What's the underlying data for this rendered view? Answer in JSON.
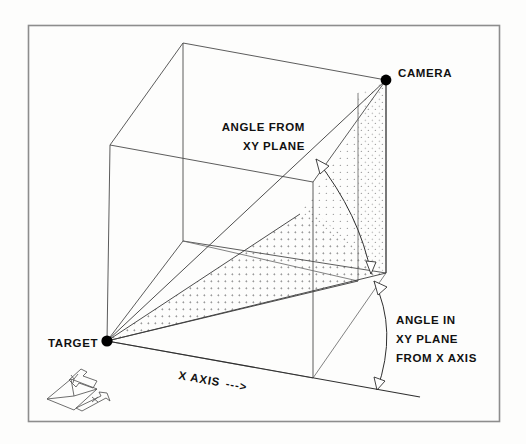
{
  "figure": {
    "kind": "technical-line-diagram",
    "title_text_visible": false,
    "background_color": "#fdfdfc",
    "frame_color": "#8d8d8d",
    "ink_color": "#2f2f2f",
    "stipple_color": "#9a9a9a"
  },
  "labels": {
    "camera": "CAMERA",
    "target": "TARGET",
    "angle_from_xy_plane": [
      "ANGLE FROM",
      "XY PLANE"
    ],
    "angle_in_xy_plane": [
      "ANGLE IN",
      "XY PLANE",
      "FROM X AXIS"
    ],
    "x_axis": "X AXIS",
    "x_axis_arrow": "--->"
  },
  "points": {
    "camera": {
      "x": 386,
      "y": 80
    },
    "target": {
      "x": 107,
      "y": 341
    },
    "camera_ground_projection": {
      "x": 386,
      "y": 273
    },
    "cube_top_back": {
      "x": 183,
      "y": 43
    },
    "cube_top_left_front": {
      "x": 110,
      "y": 145
    },
    "cube_bottom_left_front": {
      "x": 107,
      "y": 341
    },
    "cube_mid_vertical_top": {
      "x": 183,
      "y": 43
    },
    "plane_corner_right": {
      "x": 386,
      "y": 273
    },
    "x_axis_end": {
      "x": 392,
      "y": 393
    }
  },
  "annotations": {
    "elevation_arc": {
      "name": "angle-from-xy-plane-arc",
      "from_label": "ANGLE FROM XY PLANE",
      "double_headed": true
    },
    "azimuth_arc": {
      "name": "angle-in-xy-plane-arc",
      "from_label": "ANGLE IN XY PLANE FROM X AXIS",
      "double_headed": true
    }
  },
  "axes_glyph": {
    "name": "xy-axes-indicator",
    "axis_letters": [
      "Y",
      "X"
    ],
    "position": {
      "x": 45,
      "y": 366,
      "width": 78,
      "height": 56
    }
  },
  "shaded_region": {
    "name": "camera-target-triangle-shading",
    "fill_style": "dotted-stipple",
    "description": "triangular/quad region spanned by target, camera and the camera ground projection"
  }
}
